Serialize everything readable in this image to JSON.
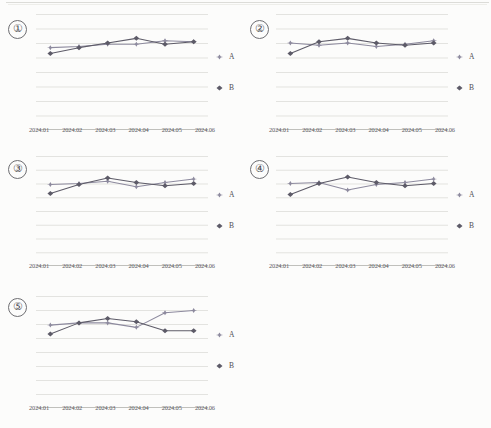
{
  "document": {
    "kind": "scanned-report-page",
    "panel_count": 5
  },
  "panels": [
    {
      "number": "①",
      "name": "chart-1"
    },
    {
      "number": "②",
      "name": "chart-2"
    },
    {
      "number": "③",
      "name": "chart-3"
    },
    {
      "number": "④",
      "name": "chart-4"
    },
    {
      "number": "⑤",
      "name": "chart-5"
    }
  ],
  "legend": {
    "series_a_label": "A",
    "series_b_label": "B",
    "series_a_marker": "triangle-marker",
    "series_b_marker": "diamond-marker"
  },
  "colors": {
    "series_a": "#8d8a9e",
    "series_b": "#5d5b68",
    "gridline": "#d8d8d4",
    "axis": "#b9b9b4",
    "text": "#4e4e54"
  },
  "chart_data": [
    {
      "type": "line",
      "title": "①",
      "xlabel": "",
      "ylabel": "",
      "grid": true,
      "gridlines": 9,
      "legend_position": "right",
      "ylim": [
        0,
        100
      ],
      "categories": [
        "2024.01",
        "2024.02",
        "2024.03",
        "2024.04",
        "2024.05",
        "2024.06"
      ],
      "series": [
        {
          "name": "A",
          "values": [
            71,
            72,
            74,
            74,
            77,
            76
          ]
        },
        {
          "name": "B",
          "values": [
            66,
            71,
            75,
            79,
            74,
            76
          ]
        }
      ]
    },
    {
      "type": "line",
      "title": "②",
      "xlabel": "",
      "ylabel": "",
      "grid": true,
      "gridlines": 9,
      "legend_position": "right",
      "ylim": [
        0,
        100
      ],
      "categories": [
        "2024.01",
        "2024.02",
        "2024.03",
        "2024.04",
        "2024.05",
        "2024.06"
      ],
      "series": [
        {
          "name": "A",
          "values": [
            75,
            73,
            75,
            72,
            74,
            77
          ]
        },
        {
          "name": "B",
          "values": [
            66,
            76,
            79,
            75,
            73,
            75
          ]
        }
      ]
    },
    {
      "type": "line",
      "title": "③",
      "xlabel": "",
      "ylabel": "",
      "grid": true,
      "gridlines": 9,
      "legend_position": "right",
      "ylim": [
        0,
        100
      ],
      "categories": [
        "2024.01",
        "2024.02",
        "2024.03",
        "2024.04",
        "2024.05",
        "2024.06"
      ],
      "series": [
        {
          "name": "A",
          "values": [
            74,
            75,
            77,
            72,
            76,
            79
          ]
        },
        {
          "name": "B",
          "values": [
            66,
            74,
            80,
            76,
            73,
            75
          ]
        }
      ]
    },
    {
      "type": "line",
      "title": "④",
      "xlabel": "",
      "ylabel": "",
      "grid": true,
      "gridlines": 9,
      "legend_position": "right",
      "ylim": [
        0,
        100
      ],
      "categories": [
        "2024.01",
        "2024.02",
        "2024.03",
        "2024.04",
        "2024.05",
        "2024.06"
      ],
      "series": [
        {
          "name": "A",
          "values": [
            75,
            76,
            69,
            74,
            76,
            79
          ]
        },
        {
          "name": "B",
          "values": [
            65,
            75,
            81,
            76,
            73,
            75
          ]
        }
      ]
    },
    {
      "type": "line",
      "title": "⑤",
      "xlabel": "",
      "ylabel": "",
      "grid": true,
      "gridlines": 9,
      "legend_position": "right",
      "ylim": [
        0,
        100
      ],
      "categories": [
        "2024.01",
        "2024.02",
        "2024.03",
        "2024.04",
        "2024.05",
        "2024.06"
      ],
      "series": [
        {
          "name": "A",
          "values": [
            74,
            76,
            76,
            72,
            85,
            87
          ]
        },
        {
          "name": "B",
          "values": [
            66,
            76,
            80,
            77,
            69,
            69
          ]
        }
      ]
    }
  ]
}
